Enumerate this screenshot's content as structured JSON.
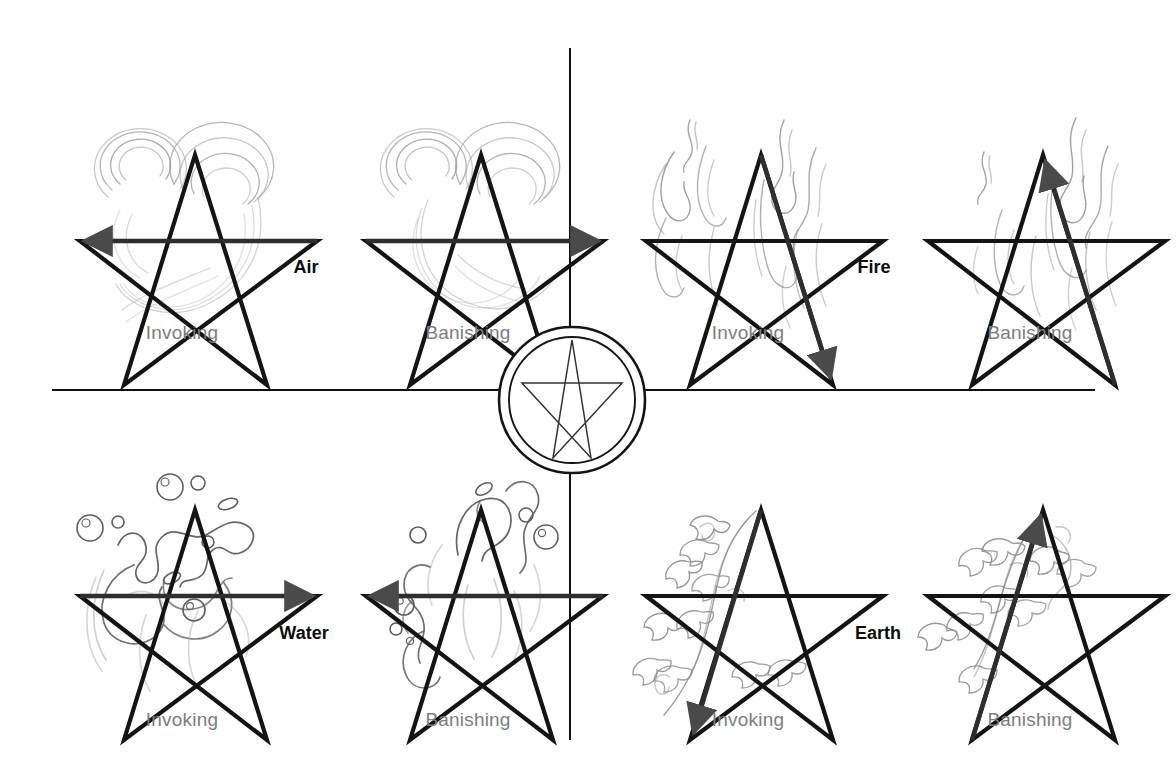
{
  "diagram": {
    "background_color": "#ffffff",
    "line_color": "#111111",
    "caption_color": "#7d7d7d",
    "element_label_color": "#0d0d0d",
    "center_emblem": {
      "name": "pentacle",
      "circles": 2,
      "star_points": 5
    },
    "dividers": {
      "vertical": {
        "x": 570,
        "y1": 48,
        "y2": 740
      },
      "horizontal": {
        "y": 390,
        "x1": 52,
        "x2": 1095
      }
    }
  },
  "quadrants": [
    {
      "element": "Air",
      "motif": "swirl-icon",
      "motif_color": "#9a9a9a",
      "panels": [
        {
          "caption": "Invoking",
          "stroke": "top-right-to-upper-left",
          "arrow_direction": "left"
        },
        {
          "caption": "Banishing",
          "stroke": "upper-left-to-top-right",
          "arrow_direction": "right"
        }
      ]
    },
    {
      "element": "Fire",
      "motif": "flame-icon",
      "motif_color": "#8d8d8d",
      "panels": [
        {
          "caption": "Invoking",
          "stroke": "top-to-lower-right",
          "arrow_direction": "down-right"
        },
        {
          "caption": "Banishing",
          "stroke": "lower-right-to-top",
          "arrow_direction": "up-left"
        }
      ]
    },
    {
      "element": "Water",
      "motif": "splash-icon",
      "motif_color": "#6f6f6f",
      "panels": [
        {
          "caption": "Invoking",
          "stroke": "upper-left-to-top-right",
          "arrow_direction": "right"
        },
        {
          "caption": "Banishing",
          "stroke": "top-right-to-upper-left",
          "arrow_direction": "left"
        }
      ]
    },
    {
      "element": "Earth",
      "motif": "ivy-icon",
      "motif_color": "#8a8a8a",
      "panels": [
        {
          "caption": "Invoking",
          "stroke": "top-to-lower-left",
          "arrow_direction": "down-left"
        },
        {
          "caption": "Banishing",
          "stroke": "lower-left-to-top",
          "arrow_direction": "up-right"
        }
      ]
    }
  ]
}
